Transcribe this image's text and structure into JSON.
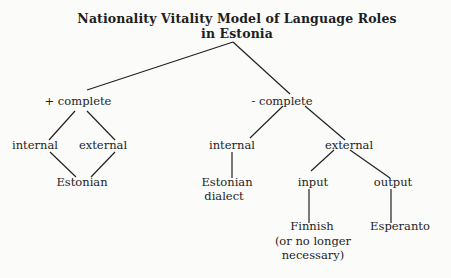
{
  "title": {
    "line1": "Nationality Vitality Model of Language Roles",
    "line2": "in Estonia"
  },
  "tree": {
    "root": "Nationality Vitality Model of Language Roles in Estonia",
    "plus_complete": {
      "label": "+ complete",
      "internal": "internal",
      "external": "external",
      "language": "Estonian"
    },
    "minus_complete": {
      "label": "- complete",
      "internal": {
        "label": "internal",
        "language_line1": "Estonian",
        "language_line2": "dialect"
      },
      "external": {
        "label": "external",
        "input": {
          "label": "input",
          "language_line1": "Finnish",
          "language_line2": "(or no longer",
          "language_line3": "necessary)"
        },
        "output": {
          "label": "output",
          "language": "Esperanto"
        }
      }
    }
  },
  "colors": {
    "background": "#fbfbf9",
    "ink": "#1e1e1e"
  }
}
